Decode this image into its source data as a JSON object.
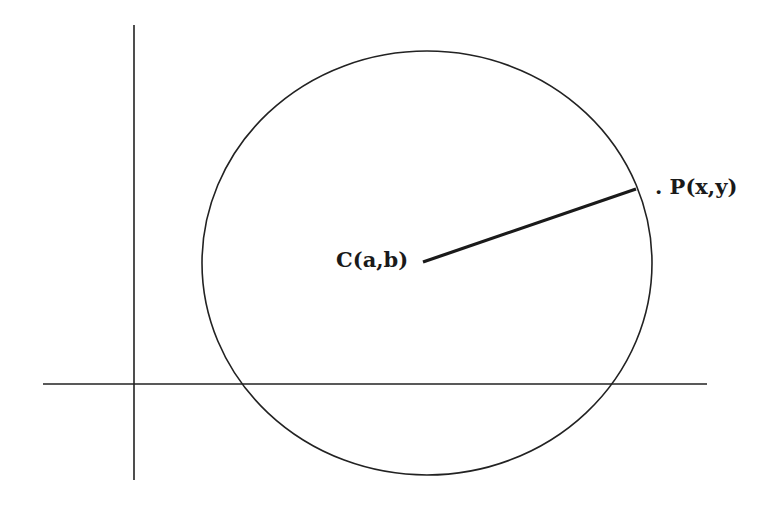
{
  "diagram": {
    "type": "circle-on-coordinate-axes",
    "colors": {
      "stroke": "#222222",
      "background": "#ffffff"
    },
    "axes": {
      "y_axis": {
        "x": 134,
        "y1": 25,
        "y2": 480
      },
      "x_axis": {
        "y": 384,
        "x1": 43,
        "x2": 707
      }
    },
    "circle": {
      "cx": 427,
      "cy": 263,
      "rx": 225,
      "ry": 212
    },
    "radius_segment": {
      "x1": 423,
      "y1": 262,
      "x2": 636,
      "y2": 189
    },
    "labels": {
      "center": "C(a,b)",
      "point": ". P(x,y)"
    }
  }
}
